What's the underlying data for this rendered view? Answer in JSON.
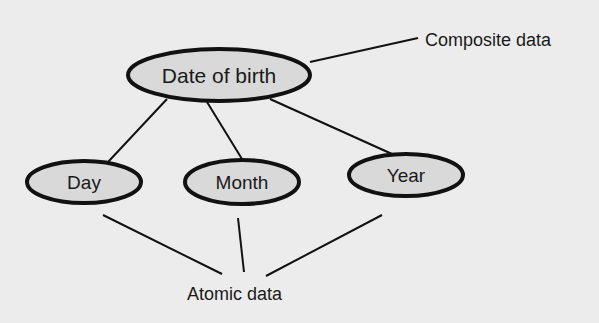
{
  "diagram": {
    "composite_label": "Composite data",
    "atomic_label": "Atomic data",
    "root": {
      "label": "Date of birth"
    },
    "children": [
      {
        "label": "Day"
      },
      {
        "label": "Month"
      },
      {
        "label": "Year"
      }
    ],
    "colors": {
      "background": "#ececec",
      "node_fill": "#d9d9d9",
      "stroke": "#111111"
    }
  }
}
